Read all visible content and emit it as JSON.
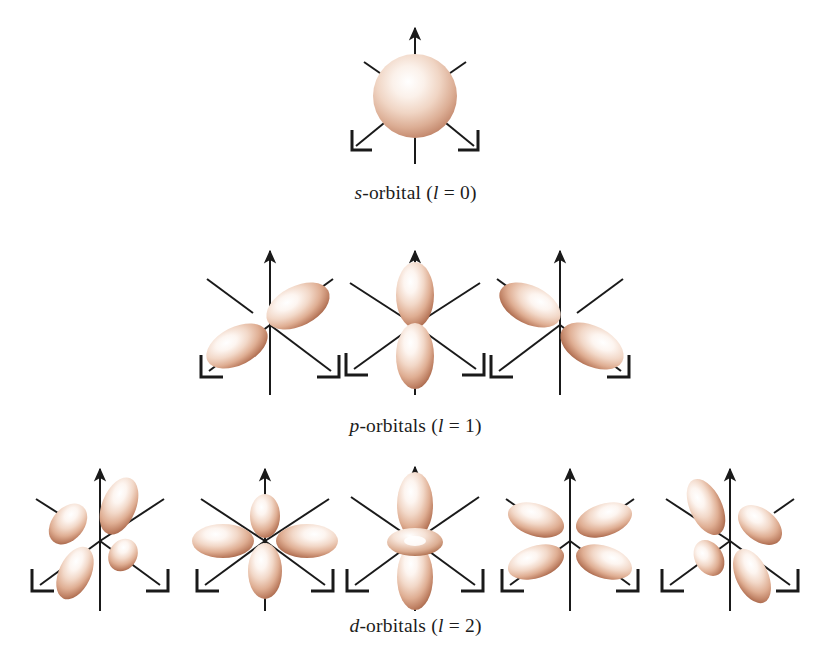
{
  "figure": {
    "background_color": "#ffffff",
    "axis_color": "#1a1a1a",
    "lobe_highlight_color": "#ffffff",
    "lobe_mid_color": "#e8c3ae",
    "lobe_shadow_color": "#a8664a",
    "lobe_edge_color": "#8c4f36",
    "caption_color": "#1c1c1c"
  },
  "rows": [
    {
      "id": "s-row",
      "caption": {
        "symbol": "s",
        "dash_and_word": "-orbital ",
        "open_paren": "(",
        "quantum_letter": "l",
        "equals_value": " = 0",
        "close_paren": ")",
        "full_text": "s-orbital (l = 0)"
      },
      "orbitals": [
        {
          "name": "s",
          "shape": "sphere",
          "label": "s orbital"
        }
      ]
    },
    {
      "id": "p-row",
      "caption": {
        "symbol": "p",
        "dash_and_word": "-orbitals ",
        "open_paren": "(",
        "quantum_letter": "l",
        "equals_value": " = 1",
        "close_paren": ")",
        "full_text": "p-orbitals (l = 1)"
      },
      "orbitals": [
        {
          "name": "px",
          "shape": "two-lobe-diagonal-up-right",
          "label": "p orbital along x axis"
        },
        {
          "name": "pz",
          "shape": "two-lobe-vertical",
          "label": "p orbital along z axis"
        },
        {
          "name": "py",
          "shape": "two-lobe-diagonal-up-left",
          "label": "p orbital along y axis"
        }
      ]
    },
    {
      "id": "d-row",
      "caption": {
        "symbol": "d",
        "dash_and_word": "-orbitals ",
        "open_paren": "(",
        "quantum_letter": "l",
        "equals_value": " = 2",
        "close_paren": ")",
        "full_text": "d-orbitals (l = 2)"
      },
      "orbitals": [
        {
          "name": "d-cloverleaf-1",
          "shape": "four-lobe-tilted",
          "label": "d orbital four lobes tilted"
        },
        {
          "name": "d-cloverleaf-2",
          "shape": "four-lobe-axial",
          "label": "d orbital four lobes on axes"
        },
        {
          "name": "dz2",
          "shape": "two-lobe-vertical-with-torus",
          "label": "d z-squared orbital with ring"
        },
        {
          "name": "d-cloverleaf-3",
          "shape": "four-lobe-butterfly",
          "label": "d orbital four lobes butterfly"
        },
        {
          "name": "d-cloverleaf-4",
          "shape": "four-lobe-rotated",
          "label": "d orbital four lobes rotated"
        }
      ]
    }
  ]
}
